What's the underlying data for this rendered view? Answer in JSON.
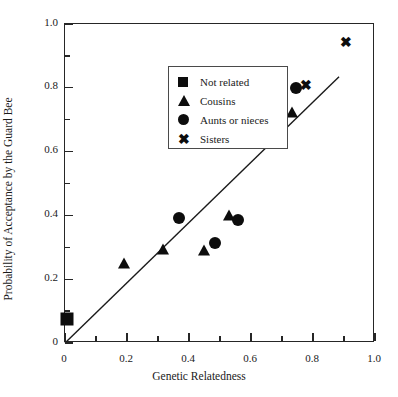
{
  "chart_data": {
    "type": "scatter",
    "title": "",
    "xlabel": "Genetic Relatedness",
    "ylabel": "Probability of Acceptance by the Guard Bee",
    "xlim": [
      0,
      1.0
    ],
    "ylim": [
      0,
      1.0
    ],
    "grid": false,
    "xticks": [
      "0",
      "0.2",
      "0.4",
      "0.6",
      "0.8",
      "1.0"
    ],
    "xtick_values": [
      0,
      0.2,
      0.4,
      0.6,
      0.8,
      1.0
    ],
    "yticks": [
      "0",
      "0.2",
      "0.4",
      "0.6",
      "0.8",
      "1.0"
    ],
    "ytick_values": [
      0,
      0.2,
      0.4,
      0.6,
      0.8,
      1.0
    ],
    "minor_tick_step": 0.1,
    "legend_position": "upper left",
    "series": [
      {
        "name": "Not related",
        "marker": "square",
        "color": "#0d0d0d",
        "points": [
          [
            0.007,
            0.075
          ]
        ]
      },
      {
        "name": "Cousins",
        "marker": "triangle",
        "color": "#0d0d0d",
        "points": [
          [
            0.19,
            0.25
          ],
          [
            0.316,
            0.295
          ],
          [
            0.449,
            0.29
          ],
          [
            0.53,
            0.4
          ],
          [
            0.733,
            0.725
          ]
        ]
      },
      {
        "name": "Aunts or nieces",
        "marker": "circle",
        "color": "#0d0d0d",
        "points": [
          [
            0.368,
            0.392
          ],
          [
            0.484,
            0.312
          ],
          [
            0.557,
            0.385
          ],
          [
            0.745,
            0.8
          ]
        ]
      },
      {
        "name": "Sisters",
        "marker": "x",
        "color": "#0d0d0d",
        "points": [
          [
            0.777,
            0.808
          ],
          [
            0.906,
            0.945
          ]
        ]
      }
    ],
    "trendline": {
      "type": "line",
      "from": [
        0.0,
        0.0
      ],
      "to": [
        0.884,
        0.835
      ],
      "color": "#1a1a1a"
    },
    "annotations": []
  },
  "axes": {
    "y_label": "Probability of Acceptance by the Guard Bee",
    "x_label": "Genetic Relatedness",
    "y_tick_labels": [
      "1.0",
      "0.8",
      "0.6",
      "0.4",
      "0.2",
      "0"
    ],
    "x_tick_labels": [
      "0",
      "0.2",
      "0.4",
      "0.6",
      "0.8",
      "1.0"
    ]
  },
  "legend": {
    "entries": [
      {
        "label": "Not related",
        "symbol": "square-marker"
      },
      {
        "label": "Cousins",
        "symbol": "triangle-marker"
      },
      {
        "label": "Aunts or nieces",
        "symbol": "circle-marker"
      },
      {
        "label": "Sisters",
        "symbol": "x-marker"
      }
    ]
  }
}
